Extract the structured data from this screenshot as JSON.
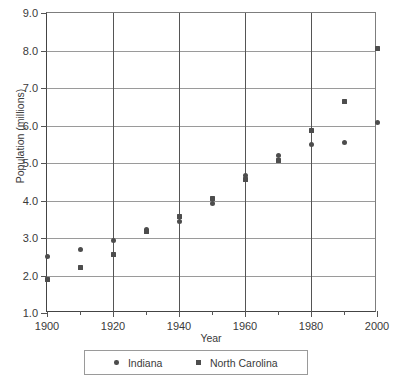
{
  "chart_data": {
    "type": "scatter",
    "title": "",
    "xlabel": "Year",
    "ylabel": "Population (millions)",
    "xlim": [
      1900,
      2000
    ],
    "ylim": [
      1.0,
      9.0
    ],
    "x": [
      1900,
      1910,
      1920,
      1930,
      1940,
      1950,
      1960,
      1970,
      1980,
      1990,
      2000
    ],
    "xticks": [
      1900,
      1920,
      1940,
      1960,
      1980,
      2000
    ],
    "xtick_labels": [
      "1900",
      "1920",
      "1940",
      "1960",
      "1980",
      "2000"
    ],
    "xminor_ticks": [
      1910,
      1930,
      1950,
      1970,
      1990
    ],
    "yticks": [
      1.0,
      2.0,
      3.0,
      4.0,
      5.0,
      6.0,
      7.0,
      8.0,
      9.0
    ],
    "ytick_labels": [
      "1.0",
      "2.0",
      "3.0",
      "4.0",
      "5.0",
      "6.0",
      "7.0",
      "8.0",
      "9.0"
    ],
    "grid": "both",
    "legend_position": "below-axes",
    "series": [
      {
        "name": "Indiana",
        "marker": "circle",
        "color": "#4d4d4d",
        "values": [
          2.52,
          2.7,
          2.93,
          3.24,
          3.43,
          3.93,
          4.66,
          5.2,
          5.5,
          5.55,
          6.08
        ]
      },
      {
        "name": "North Carolina",
        "marker": "square",
        "color": "#4d4d4d",
        "values": [
          1.89,
          2.21,
          2.56,
          3.17,
          3.57,
          4.06,
          4.56,
          5.08,
          5.88,
          6.63,
          8.05
        ]
      }
    ]
  },
  "legend": {
    "entries": [
      {
        "label": "Indiana",
        "marker": "circle"
      },
      {
        "label": "North Carolina",
        "marker": "square"
      }
    ]
  },
  "footnote": ""
}
